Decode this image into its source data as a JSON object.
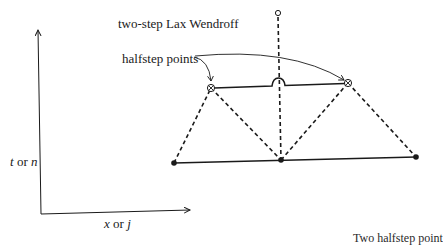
{
  "diagram": {
    "title": "two-step Lax Wendroff",
    "annotation": "halfstep points",
    "axes": {
      "y_label_var1": "t",
      "y_label_or": "or",
      "y_label_var2": "n",
      "x_label_var1": "x",
      "x_label_or": "or",
      "x_label_var2": "j"
    },
    "caption_fragment": "Two halfstep point",
    "nodes": {
      "top_open": {
        "type": "open-circle"
      },
      "halfstep_left": {
        "type": "crossed-circle"
      },
      "halfstep_right": {
        "type": "crossed-circle"
      },
      "bottom_left": {
        "type": "filled-dot"
      },
      "bottom_middle": {
        "type": "filled-dot"
      },
      "bottom_right": {
        "type": "filled-dot"
      }
    },
    "colors": {
      "ink": "#1a1a1a",
      "background": "#ffffff"
    }
  }
}
